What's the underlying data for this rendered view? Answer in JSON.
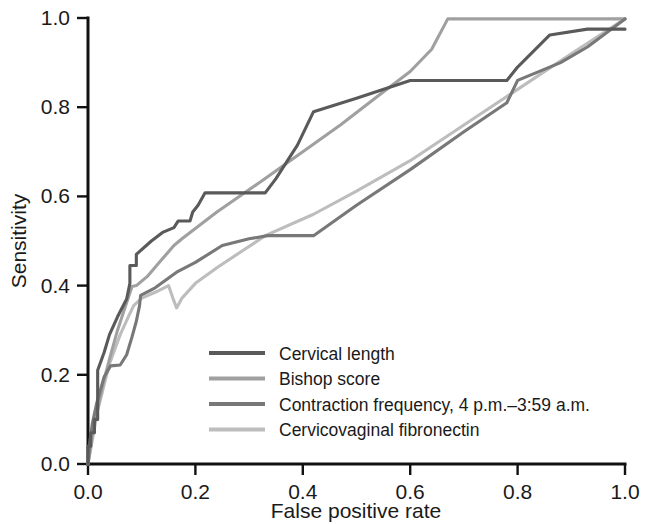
{
  "chart_data": {
    "type": "line",
    "title": "",
    "xlabel": "False positive rate",
    "ylabel": "Sensitivity",
    "xlim": [
      0.0,
      1.0
    ],
    "ylim": [
      0.0,
      1.0
    ],
    "xticks": [
      "0.0",
      "0.2",
      "0.4",
      "0.6",
      "0.8",
      "1.0"
    ],
    "yticks": [
      "0.0",
      "0.2",
      "0.4",
      "0.6",
      "0.8",
      "1.0"
    ],
    "xtick_values": [
      0.0,
      0.2,
      0.4,
      0.6,
      0.8,
      1.0
    ],
    "ytick_values": [
      0.0,
      0.2,
      0.4,
      0.6,
      0.8,
      1.0
    ],
    "grid": false,
    "legend_position": "lower-right-inside",
    "series": [
      {
        "name": "Cervical length",
        "color": "#5a5a5a",
        "points": [
          [
            0.0,
            0.0
          ],
          [
            0.0,
            0.04
          ],
          [
            0.005,
            0.04
          ],
          [
            0.005,
            0.07
          ],
          [
            0.012,
            0.07
          ],
          [
            0.012,
            0.1
          ],
          [
            0.018,
            0.1
          ],
          [
            0.018,
            0.21
          ],
          [
            0.03,
            0.25
          ],
          [
            0.04,
            0.29
          ],
          [
            0.055,
            0.33
          ],
          [
            0.072,
            0.37
          ],
          [
            0.078,
            0.405
          ],
          [
            0.078,
            0.445
          ],
          [
            0.09,
            0.445
          ],
          [
            0.09,
            0.47
          ],
          [
            0.118,
            0.5
          ],
          [
            0.14,
            0.52
          ],
          [
            0.16,
            0.53
          ],
          [
            0.168,
            0.545
          ],
          [
            0.19,
            0.545
          ],
          [
            0.195,
            0.565
          ],
          [
            0.205,
            0.58
          ],
          [
            0.218,
            0.608
          ],
          [
            0.33,
            0.608
          ],
          [
            0.35,
            0.64
          ],
          [
            0.39,
            0.715
          ],
          [
            0.42,
            0.79
          ],
          [
            0.5,
            0.82
          ],
          [
            0.6,
            0.86
          ],
          [
            0.78,
            0.86
          ],
          [
            0.8,
            0.89
          ],
          [
            0.86,
            0.962
          ],
          [
            0.93,
            0.975
          ],
          [
            1.0,
            0.975
          ]
        ]
      },
      {
        "name": "Bishop score",
        "color": "#a0a0a0",
        "points": [
          [
            0.0,
            0.0
          ],
          [
            0.01,
            0.08
          ],
          [
            0.028,
            0.18
          ],
          [
            0.04,
            0.235
          ],
          [
            0.055,
            0.3
          ],
          [
            0.07,
            0.355
          ],
          [
            0.082,
            0.398
          ],
          [
            0.09,
            0.4
          ],
          [
            0.11,
            0.42
          ],
          [
            0.135,
            0.455
          ],
          [
            0.16,
            0.49
          ],
          [
            0.175,
            0.505
          ],
          [
            0.24,
            0.565
          ],
          [
            0.33,
            0.64
          ],
          [
            0.4,
            0.7
          ],
          [
            0.47,
            0.76
          ],
          [
            0.54,
            0.825
          ],
          [
            0.6,
            0.88
          ],
          [
            0.64,
            0.93
          ],
          [
            0.67,
            0.998
          ],
          [
            1.0,
            0.998
          ]
        ]
      },
      {
        "name": "Contraction frequency, 4 p.m.–3:59 a.m.",
        "color": "#787878",
        "points": [
          [
            0.0,
            0.0
          ],
          [
            0.004,
            0.055
          ],
          [
            0.008,
            0.09
          ],
          [
            0.016,
            0.135
          ],
          [
            0.03,
            0.195
          ],
          [
            0.042,
            0.22
          ],
          [
            0.06,
            0.222
          ],
          [
            0.072,
            0.245
          ],
          [
            0.082,
            0.285
          ],
          [
            0.09,
            0.32
          ],
          [
            0.096,
            0.355
          ],
          [
            0.098,
            0.378
          ],
          [
            0.125,
            0.395
          ],
          [
            0.165,
            0.43
          ],
          [
            0.2,
            0.452
          ],
          [
            0.25,
            0.49
          ],
          [
            0.3,
            0.505
          ],
          [
            0.335,
            0.512
          ],
          [
            0.42,
            0.512
          ],
          [
            0.5,
            0.58
          ],
          [
            0.6,
            0.66
          ],
          [
            0.7,
            0.745
          ],
          [
            0.78,
            0.81
          ],
          [
            0.8,
            0.86
          ],
          [
            0.88,
            0.9
          ],
          [
            0.93,
            0.935
          ],
          [
            1.0,
            0.998
          ]
        ]
      },
      {
        "name": "Cervicovaginal fibronectin",
        "color": "#bdbdbd",
        "points": [
          [
            0.0,
            0.0
          ],
          [
            0.018,
            0.12
          ],
          [
            0.04,
            0.225
          ],
          [
            0.06,
            0.29
          ],
          [
            0.075,
            0.33
          ],
          [
            0.085,
            0.355
          ],
          [
            0.1,
            0.372
          ],
          [
            0.125,
            0.385
          ],
          [
            0.15,
            0.4
          ],
          [
            0.158,
            0.372
          ],
          [
            0.165,
            0.35
          ],
          [
            0.175,
            0.372
          ],
          [
            0.2,
            0.405
          ],
          [
            0.24,
            0.44
          ],
          [
            0.28,
            0.472
          ],
          [
            0.33,
            0.512
          ],
          [
            0.42,
            0.56
          ],
          [
            0.5,
            0.612
          ],
          [
            0.6,
            0.68
          ],
          [
            0.7,
            0.76
          ],
          [
            0.8,
            0.84
          ],
          [
            0.9,
            0.92
          ],
          [
            1.0,
            0.998
          ]
        ]
      }
    ],
    "legend_entries": [
      {
        "label": "Cervical length",
        "color": "#5a5a5a"
      },
      {
        "label": "Bishop score",
        "color": "#a0a0a0"
      },
      {
        "label": "Contraction frequency, 4 p.m.–3:59 a.m.",
        "color": "#787878"
      },
      {
        "label": "Cervicovaginal fibronectin",
        "color": "#bdbdbd"
      }
    ]
  }
}
